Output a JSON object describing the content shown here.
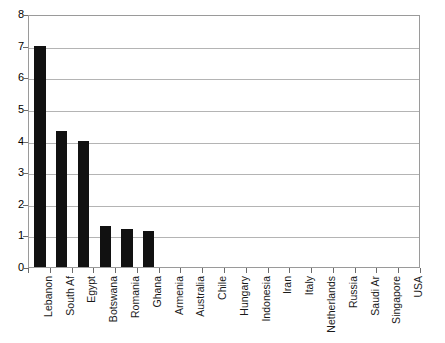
{
  "chart_data": {
    "type": "bar",
    "title": "",
    "subtitle": "",
    "xlabel": "",
    "ylabel": "",
    "ylim": [
      0,
      8
    ],
    "ytick_step": 1,
    "yticks": [
      "0",
      "1",
      "2",
      "3",
      "4",
      "5",
      "6",
      "7",
      "8"
    ],
    "grid": true,
    "legend": false,
    "bar_color": "#111111",
    "grid_color": "#b4b4b4",
    "axis_color": "#9a9a9a",
    "categories": [
      "Lebanon",
      "South Af",
      "Egypt",
      "Botswana",
      "Romania",
      "Ghana",
      "Armenia",
      "Australia",
      "Chile",
      "Hungary",
      "Indonesia",
      "Iran",
      "Italy",
      "Netherlands",
      "Russia",
      "Saudi Ar",
      "Singapore",
      "USA"
    ],
    "values": [
      7,
      4.3,
      4,
      1.3,
      1.2,
      1.15,
      0,
      0,
      0,
      0,
      0,
      0,
      0,
      0,
      0,
      0,
      0,
      0
    ]
  }
}
